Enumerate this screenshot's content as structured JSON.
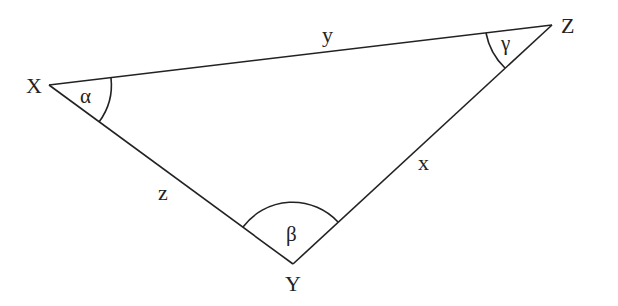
{
  "diagram": {
    "vertices": {
      "X": {
        "label": "X",
        "x": 49,
        "y": 85
      },
      "Y": {
        "label": "Y",
        "x": 293,
        "y": 264
      },
      "Z": {
        "label": "Z",
        "x": 552,
        "y": 25
      }
    },
    "sides": {
      "x": {
        "label": "x",
        "opposite": "X"
      },
      "y": {
        "label": "y",
        "opposite": "Y"
      },
      "z": {
        "label": "z",
        "opposite": "Z"
      }
    },
    "angles": {
      "alpha": {
        "label": "α",
        "vertex": "X"
      },
      "beta": {
        "label": "β",
        "vertex": "Y"
      },
      "gamma": {
        "label": "γ",
        "vertex": "Z"
      }
    },
    "colors": {
      "stroke": "#222222",
      "background": "#ffffff"
    }
  }
}
